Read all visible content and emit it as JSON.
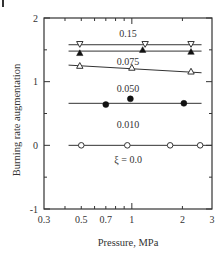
{
  "chart_data": {
    "type": "scatter",
    "title": "",
    "xlabel": "Pressure,  MPa",
    "ylabel": "Burning rate  augmentation",
    "xscale": "log",
    "xlim": [
      0.3,
      3
    ],
    "ylim": [
      -1,
      2
    ],
    "x_ticks": [
      0.3,
      0.5,
      0.7,
      1,
      2,
      3
    ],
    "x_tick_labels": [
      "0.3",
      "0.5",
      "0.7",
      "1",
      "2",
      "3"
    ],
    "x_minor_ticks": [
      0.4,
      0.5,
      0.6,
      0.7,
      0.8,
      0.9,
      2
    ],
    "y_ticks": [
      -1,
      0,
      1,
      2
    ],
    "y_tick_labels": [
      "-1",
      "0",
      "1",
      "2"
    ],
    "y_minor_ticks": [
      -0.5,
      0.5,
      1.5
    ],
    "grid": false,
    "legend_position": "inline labels",
    "series": [
      {
        "name": "0.15",
        "marker": "open-down-triangle",
        "x": [
          0.49,
          1.2,
          2.25
        ],
        "y": [
          1.59,
          1.59,
          1.59
        ],
        "fit_line": {
          "x": [
            0.42,
            2.6
          ],
          "y": [
            1.58,
            1.58
          ]
        },
        "label_pos": {
          "x": 0.95,
          "y": 1.75
        }
      },
      {
        "name": "0.075",
        "marker": "filled-up-triangle",
        "x": [
          0.49,
          1.16,
          2.25
        ],
        "y": [
          1.45,
          1.5,
          1.47
        ],
        "fit_line": {
          "x": [
            0.42,
            2.6
          ],
          "y": [
            1.48,
            1.48
          ]
        },
        "label_pos": {
          "x": 0.95,
          "y": 1.31
        }
      },
      {
        "name": "0.050",
        "marker": "open-up-triangle",
        "x": [
          0.49,
          1.0,
          2.25
        ],
        "y": [
          1.25,
          1.22,
          1.16
        ],
        "fit_line": {
          "x": [
            0.42,
            2.6
          ],
          "y": [
            1.26,
            1.14
          ]
        },
        "label_pos": {
          "x": 0.95,
          "y": 0.9
        }
      },
      {
        "name": "0.010",
        "marker": "filled-circle",
        "x": [
          0.7,
          0.98,
          2.04
        ],
        "y": [
          0.64,
          0.73,
          0.66
        ],
        "fit_line": {
          "x": [
            0.42,
            2.6
          ],
          "y": [
            0.66,
            0.66
          ]
        },
        "label_pos": {
          "x": 0.95,
          "y": 0.33
        }
      },
      {
        "name": "ξ = 0.0",
        "marker": "open-circle",
        "x": [
          0.5,
          0.94,
          1.69,
          2.55
        ],
        "y": [
          0.0,
          0.0,
          0.0,
          0.0
        ],
        "fit_line": {
          "x": [
            0.42,
            3.0
          ],
          "y": [
            0.0,
            0.0
          ]
        },
        "label_pos": {
          "x": 0.95,
          "y": -0.22
        }
      }
    ]
  }
}
